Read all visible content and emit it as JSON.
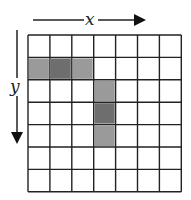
{
  "diagram": {
    "axis_x_label": "x",
    "axis_y_label": "y",
    "grid": {
      "cols": 7,
      "rows": 7
    },
    "colors": {
      "light": "#9a9a9a",
      "dark": "#6e6e6e",
      "line": "#222222"
    },
    "cells": [
      {
        "row": 1,
        "col": 0,
        "shade": "light"
      },
      {
        "row": 1,
        "col": 1,
        "shade": "dark"
      },
      {
        "row": 1,
        "col": 2,
        "shade": "light"
      },
      {
        "row": 2,
        "col": 3,
        "shade": "light"
      },
      {
        "row": 3,
        "col": 3,
        "shade": "dark"
      },
      {
        "row": 4,
        "col": 3,
        "shade": "light"
      }
    ]
  }
}
